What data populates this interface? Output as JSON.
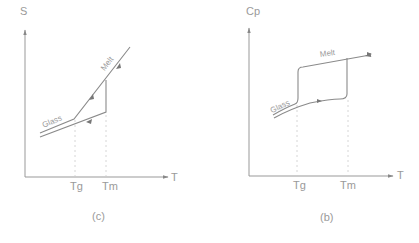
{
  "panels": [
    {
      "id": "a",
      "caption": "(c)",
      "y_axis_label": "S",
      "x_axis_label": "T",
      "tick_labels": [
        "Tg",
        "Tm"
      ],
      "curve_labels": [
        "Glass",
        "Melt"
      ]
    },
    {
      "id": "b",
      "caption": "(b)",
      "y_axis_label": "Cp",
      "x_axis_label": "T",
      "tick_labels": [
        "Tg",
        "Tm"
      ],
      "curve_labels": [
        "Glass",
        "Melt"
      ]
    }
  ],
  "colors": {
    "line": "#8a8a8a",
    "axis": "#909090",
    "text": "#9a9a9a"
  }
}
